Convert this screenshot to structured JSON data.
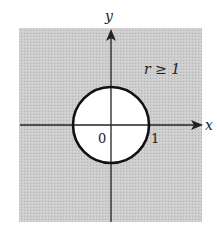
{
  "figure": {
    "region_label": "r ≥ 1",
    "x_axis_label": "x",
    "y_axis_label": "y",
    "origin_label": "0",
    "unit_label": "1",
    "colors": {
      "shaded_region": "#c8c8c8",
      "circle_interior": "#ffffff",
      "axis": "#222222",
      "circle_stroke": "#111111"
    }
  }
}
